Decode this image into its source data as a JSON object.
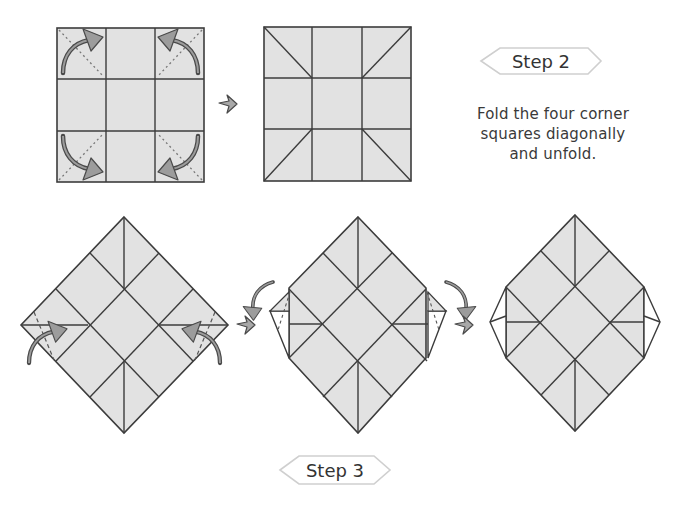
{
  "colors": {
    "paper": "#e2e2e2",
    "line": "#3c3c3c",
    "arrow_fill": "#9c9c9c",
    "arrow_stroke": "#4a4a4a",
    "label_border": "#cfcfcf",
    "flap": "#ffffff",
    "text": "#3a3a3a"
  },
  "step2": {
    "label": "Step 2",
    "instruction_lines": [
      "Fold the four corner",
      "squares diagonally",
      "and unfold."
    ]
  },
  "step3": {
    "label": "Step 3"
  },
  "figures": [
    {
      "id": "square-with-fold-arrows",
      "desc": "3x3 grid with dotted diagonals and curved fold arrows on four corner squares"
    },
    {
      "id": "square-with-creases",
      "desc": "3x3 grid with diagonal creases on four corner squares"
    },
    {
      "id": "diamond-with-fold-arrows",
      "desc": "rotated square with side corners to fold in"
    },
    {
      "id": "diamond-folding-in",
      "desc": "rotated square with side corners partially folded"
    },
    {
      "id": "diamond-folded",
      "desc": "result with side corners folded in"
    }
  ],
  "icons": {
    "process_arrow": "right-arrow",
    "fold_arrow": "curved-arrow"
  }
}
